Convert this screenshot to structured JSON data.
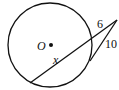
{
  "diagram": {
    "labels": {
      "center": "O",
      "internal_segment": "x",
      "external_segment": "6",
      "tangent_segment": "10"
    },
    "stroke_color": "#111111"
  }
}
